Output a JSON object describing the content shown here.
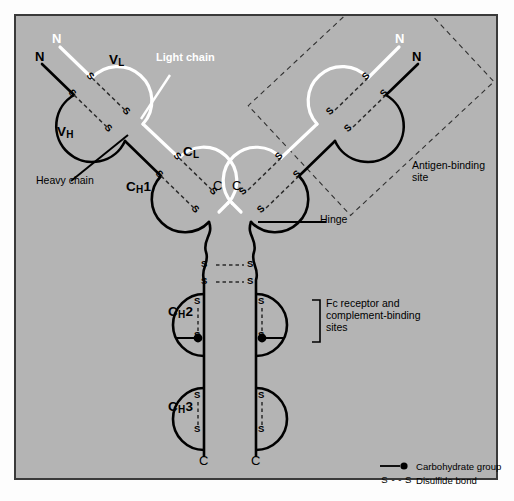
{
  "figure": {
    "background_color": "#b4b4b4",
    "frame_color": "#3a3a3a",
    "heavy_chain_color": "#000000",
    "light_chain_color": "#ffffff"
  },
  "labels": {
    "light_chain": "Light chain",
    "heavy_chain": "Heavy chain",
    "hinge": "Hinge",
    "antigen_binding_site_line1": "Antigen-binding",
    "antigen_binding_site_line2": "site",
    "fc_line1": "Fc receptor and",
    "fc_line2": "complement-binding",
    "fc_line3": "sites"
  },
  "domains": [
    {
      "id": "VL",
      "name": "V",
      "sub": "L",
      "suffix": "",
      "chain": "light",
      "arm": "left"
    },
    {
      "id": "VH",
      "name": "V",
      "sub": "H",
      "suffix": "",
      "chain": "heavy",
      "arm": "left"
    },
    {
      "id": "CL",
      "name": "C",
      "sub": "L",
      "suffix": "",
      "chain": "light",
      "arm": "left"
    },
    {
      "id": "CH1",
      "name": "C",
      "sub": "H",
      "suffix": "1",
      "chain": "heavy",
      "arm": "left"
    },
    {
      "id": "CH2",
      "name": "C",
      "sub": "H",
      "suffix": "2",
      "chain": "heavy",
      "arm": "fc"
    },
    {
      "id": "CH3",
      "name": "C",
      "sub": "H",
      "suffix": "3",
      "chain": "heavy",
      "arm": "fc"
    }
  ],
  "termini": {
    "n_label": "N",
    "c_label": "C",
    "n_positions": [
      "left-light",
      "left-heavy",
      "right-light",
      "right-heavy"
    ],
    "c_positions": [
      "left-light",
      "right-light",
      "left-heavy",
      "right-heavy"
    ]
  },
  "bond_glyph": {
    "sulfur": "S",
    "dash": "- -",
    "interchain_text": "S - - S"
  },
  "legend": {
    "items": [
      {
        "symbol": "carbohydrate-dot",
        "label": "Carbohydrate group"
      },
      {
        "symbol": "S - - S",
        "label": "Disulfide bond"
      }
    ]
  }
}
